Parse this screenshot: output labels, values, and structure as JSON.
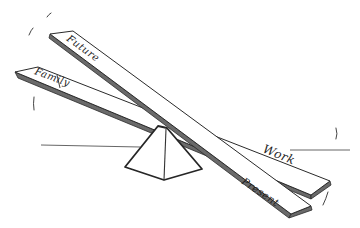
{
  "diagram": {
    "type": "hand-drawn seesaw sketch",
    "colors": {
      "ink": "#2a2a2a",
      "background": "#ffffff"
    },
    "boards": [
      {
        "id": "future-present",
        "labels": {
          "left": "Future",
          "right": "Present"
        }
      },
      {
        "id": "family-work",
        "labels": {
          "left": "Family",
          "right": "Work"
        }
      }
    ],
    "fulcrum": {
      "shape": "pyramid"
    }
  }
}
